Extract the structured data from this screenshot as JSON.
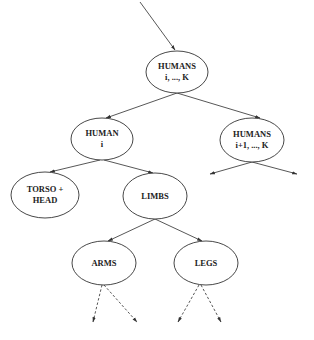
{
  "diagram": {
    "type": "tree",
    "colors": {
      "stroke": "#333333",
      "text": "#222222",
      "background": "#ffffff"
    },
    "nodes": [
      {
        "id": "humans_all",
        "lines": [
          "HUMANS",
          "i, ..., K"
        ],
        "cx": 177,
        "cy": 72,
        "rx": 31,
        "ry": 21
      },
      {
        "id": "human_i",
        "lines": [
          "HUMAN",
          "i"
        ],
        "cx": 102,
        "cy": 139,
        "rx": 31,
        "ry": 21
      },
      {
        "id": "humans_rest",
        "lines": [
          "HUMANS",
          "i+1, ..., K"
        ],
        "cx": 264,
        "cy": 140,
        "rx": 32,
        "ry": 22
      },
      {
        "id": "torso_head",
        "lines": [
          "TORSO +",
          "HEAD"
        ],
        "cx": 45,
        "cy": 195,
        "rx": 34,
        "ry": 23
      },
      {
        "id": "limbs",
        "lines": [
          "LIMBS"
        ],
        "cx": 155,
        "cy": 196,
        "rx": 32,
        "ry": 23
      },
      {
        "id": "arms",
        "lines": [
          "ARMS"
        ],
        "cx": 104,
        "cy": 263,
        "rx": 32,
        "ry": 22
      },
      {
        "id": "legs",
        "lines": [
          "LEGS"
        ],
        "cx": 206,
        "cy": 263,
        "rx": 32,
        "ry": 22
      }
    ],
    "edges": [
      {
        "from": "entry",
        "to": "humans_all",
        "style": "solid"
      },
      {
        "from": "humans_all",
        "to": "human_i",
        "style": "solid"
      },
      {
        "from": "humans_all",
        "to": "humans_rest",
        "style": "solid"
      },
      {
        "from": "human_i",
        "to": "torso_head",
        "style": "solid"
      },
      {
        "from": "human_i",
        "to": "limbs",
        "style": "solid"
      },
      {
        "from": "humans_rest",
        "to": "open-left",
        "style": "solid"
      },
      {
        "from": "humans_rest",
        "to": "open-right",
        "style": "solid"
      },
      {
        "from": "limbs",
        "to": "arms",
        "style": "solid"
      },
      {
        "from": "limbs",
        "to": "legs",
        "style": "solid"
      },
      {
        "from": "arms",
        "to": "open-left",
        "style": "dashed"
      },
      {
        "from": "arms",
        "to": "open-right",
        "style": "dashed"
      },
      {
        "from": "legs",
        "to": "open-left",
        "style": "dashed"
      },
      {
        "from": "legs",
        "to": "open-right",
        "style": "dashed"
      }
    ]
  }
}
